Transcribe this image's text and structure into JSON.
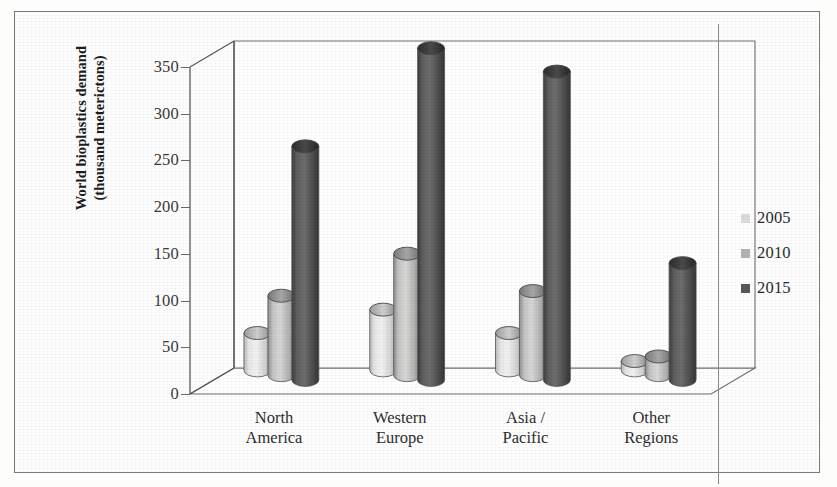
{
  "chart_data": {
    "type": "bar",
    "title": "",
    "subtitle": "",
    "xlabel": "",
    "ylabel": "World bioplastics demand (thousand meterictons)",
    "ylabel_line1": "World bioplastics demand",
    "ylabel_line2": "(thousand meterictons)",
    "categories": [
      "North America",
      "Western Europe",
      "Asia / Pacific",
      "Other Regions"
    ],
    "category_lines": [
      [
        "North",
        "America"
      ],
      [
        "Western",
        "Europe"
      ],
      [
        "Asia /",
        "Pacific"
      ],
      [
        "Other",
        "Regions"
      ]
    ],
    "series": [
      {
        "name": "2005",
        "color": "#dcdcdc",
        "values": [
          40,
          65,
          40,
          10
        ]
      },
      {
        "name": "2010",
        "color": "#b4b4b4",
        "values": [
          85,
          130,
          90,
          20
        ]
      },
      {
        "name": "2015",
        "color": "#595959",
        "values": [
          250,
          355,
          330,
          125
        ]
      }
    ],
    "ylim": [
      0,
      350
    ],
    "yticks": [
      0,
      50,
      100,
      150,
      200,
      250,
      300,
      350
    ],
    "ytick_labels": [
      "0",
      "50",
      "100",
      "150",
      "200",
      "250",
      "300",
      "350"
    ],
    "grid": false,
    "legend_position": "right",
    "style": "3d-cylinder"
  },
  "legend": {
    "entries": [
      {
        "label": "2005",
        "color": "#dcdcdc"
      },
      {
        "label": "2010",
        "color": "#b4b4b4"
      },
      {
        "label": "2015",
        "color": "#595959"
      }
    ]
  },
  "colors": {
    "series_2005": "#dcdcdc",
    "series_2010": "#b4b4b4",
    "series_2015": "#595959",
    "axis": "#555555",
    "frame": "#7a7a7a",
    "background": "#fefefe",
    "text": "#2b2b2b"
  }
}
